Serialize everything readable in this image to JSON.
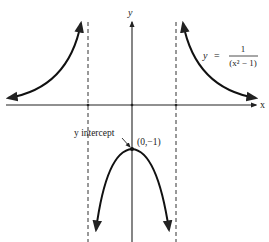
{
  "diagram": {
    "type": "function-graph",
    "axes": {
      "x_label": "x",
      "y_label": "y"
    },
    "equation": {
      "lhs": "y",
      "equals": "=",
      "numerator": "1",
      "denominator": "(x² − 1)"
    },
    "asymptotes": [
      {
        "type": "vertical",
        "x": -1,
        "style": "dashed"
      },
      {
        "type": "vertical",
        "x": 1,
        "style": "dashed"
      },
      {
        "type": "horizontal",
        "y": 0,
        "note": "x-axis"
      }
    ],
    "annotations": {
      "intercept_label": "y intercept",
      "intercept_point": "(0,−1)"
    },
    "branches": [
      {
        "name": "left",
        "domain": "x < -1",
        "sign": "positive"
      },
      {
        "name": "middle",
        "domain": "-1 < x < 1",
        "sign": "negative",
        "max": "(0,-1)"
      },
      {
        "name": "right",
        "domain": "x > 1",
        "sign": "positive"
      }
    ],
    "colors": {
      "ink": "#222222",
      "background": "#ffffff"
    }
  }
}
